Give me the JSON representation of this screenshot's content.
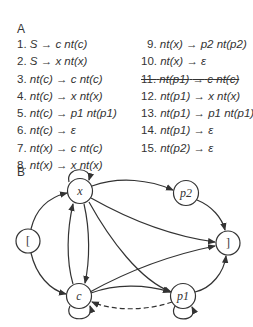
{
  "panel_a": {
    "label": "A",
    "rules_left": [
      {
        "num": "1.",
        "lhs": "S",
        "rhs": "c nt(c)",
        "struck": false
      },
      {
        "num": "2.",
        "lhs": "S",
        "rhs": "x nt(x)",
        "struck": false
      },
      {
        "num": "3.",
        "lhs": "nt(c)",
        "rhs": "c nt(c)",
        "struck": false
      },
      {
        "num": "4.",
        "lhs": "nt(c)",
        "rhs": "x nt(x)",
        "struck": false
      },
      {
        "num": "5.",
        "lhs": "nt(c)",
        "rhs": "p1 nt(p1)",
        "struck": false
      },
      {
        "num": "6.",
        "lhs": "nt(c)",
        "rhs": "ε",
        "struck": false
      },
      {
        "num": "7.",
        "lhs": "nt(x)",
        "rhs": "c nt(c)",
        "struck": false
      },
      {
        "num": "8.",
        "lhs": "nt(x)",
        "rhs": "x nt(x)",
        "struck": false
      }
    ],
    "rules_right": [
      {
        "num": "9.",
        "lhs": "nt(x)",
        "rhs": "p2 nt(p2)",
        "struck": false
      },
      {
        "num": "10.",
        "lhs": "nt(x)",
        "rhs": "ε",
        "struck": false
      },
      {
        "num": "11.",
        "lhs": "nt(p1)",
        "rhs": "c nt(c)",
        "struck": true
      },
      {
        "num": "12.",
        "lhs": "nt(p1)",
        "rhs": "x nt(x)",
        "struck": false
      },
      {
        "num": "13.",
        "lhs": "nt(p1)",
        "rhs": "p1 nt(p1)",
        "struck": false
      },
      {
        "num": "14.",
        "lhs": "nt(p1)",
        "rhs": "ε",
        "struck": false
      },
      {
        "num": "15.",
        "lhs": "nt(p2)",
        "rhs": "ε",
        "struck": false
      }
    ],
    "arrow": "→"
  },
  "panel_b": {
    "label": "B",
    "nodes": [
      {
        "id": "start",
        "label": "[",
        "x": 28,
        "y": 241
      },
      {
        "id": "x",
        "label": "x",
        "x": 80,
        "y": 191
      },
      {
        "id": "c",
        "label": "c",
        "x": 79,
        "y": 296
      },
      {
        "id": "p2",
        "label": "p2",
        "x": 186,
        "y": 193
      },
      {
        "id": "end",
        "label": "]",
        "x": 228,
        "y": 243
      },
      {
        "id": "p1",
        "label": "p1",
        "x": 183,
        "y": 296
      }
    ],
    "edges": [
      {
        "from": "start",
        "to": "x",
        "style": "solid"
      },
      {
        "from": "start",
        "to": "c",
        "style": "solid"
      },
      {
        "from": "x",
        "to": "x",
        "style": "solid"
      },
      {
        "from": "c",
        "to": "c",
        "style": "solid"
      },
      {
        "from": "p1",
        "to": "p1",
        "style": "solid"
      },
      {
        "from": "c",
        "to": "x",
        "style": "solid"
      },
      {
        "from": "x",
        "to": "c",
        "style": "solid"
      },
      {
        "from": "x",
        "to": "p2",
        "style": "solid"
      },
      {
        "from": "x",
        "to": "end",
        "style": "solid"
      },
      {
        "from": "x",
        "to": "p1",
        "style": "solid"
      },
      {
        "from": "p1",
        "to": "x",
        "style": "solid"
      },
      {
        "from": "c",
        "to": "p1",
        "style": "solid"
      },
      {
        "from": "c",
        "to": "end",
        "style": "solid"
      },
      {
        "from": "p1",
        "to": "c",
        "style": "dashed"
      },
      {
        "from": "p2",
        "to": "end",
        "style": "solid"
      },
      {
        "from": "p1",
        "to": "end",
        "style": "solid"
      }
    ]
  }
}
